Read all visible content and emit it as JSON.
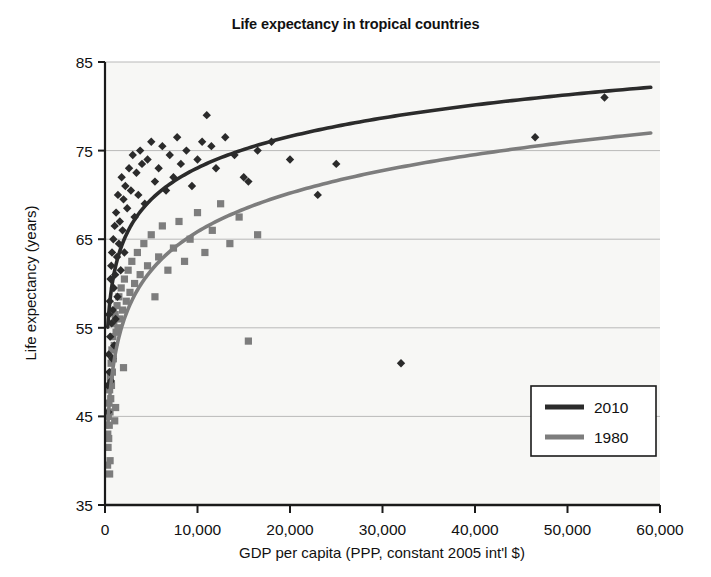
{
  "chart_data": {
    "type": "scatter",
    "title": "Life expectancy in tropical countries",
    "xlabel": "GDP per capita (PPP, constant 2005 int'l $)",
    "ylabel": "Life expectancy (years)",
    "xlim": [
      0,
      60000
    ],
    "ylim": [
      35,
      85
    ],
    "xticks": [
      0,
      10000,
      20000,
      30000,
      40000,
      50000,
      60000
    ],
    "xtick_labels": [
      "0",
      "10,000",
      "20,000",
      "30,000",
      "40,000",
      "50,000",
      "60,000"
    ],
    "yticks": [
      35,
      45,
      55,
      65,
      75,
      85
    ],
    "ytick_labels": [
      "35",
      "45",
      "55",
      "65",
      "75",
      "85"
    ],
    "grid": "horizontal",
    "legend_position": "lower-right",
    "colors": {
      "series_2010": "#2b2b2b",
      "series_1980": "#7d7d7d",
      "plot_background": "#f7f7f5",
      "gridline": "#b9b9b9",
      "axis": "#1a1a1a"
    },
    "series": [
      {
        "name": "2010",
        "marker": "diamond",
        "color": "#2b2b2b",
        "trend": "logarithmic",
        "points": [
          [
            300,
            48.5
          ],
          [
            350,
            45.5
          ],
          [
            400,
            52.0
          ],
          [
            430,
            56.5
          ],
          [
            470,
            50.0
          ],
          [
            520,
            58.0
          ],
          [
            560,
            54.0
          ],
          [
            600,
            60.5
          ],
          [
            640,
            49.0
          ],
          [
            680,
            62.0
          ],
          [
            720,
            55.5
          ],
          [
            760,
            63.5
          ],
          [
            800,
            51.5
          ],
          [
            850,
            57.0
          ],
          [
            900,
            65.0
          ],
          [
            950,
            59.5
          ],
          [
            1000,
            53.0
          ],
          [
            1050,
            66.5
          ],
          [
            1100,
            61.0
          ],
          [
            1150,
            56.0
          ],
          [
            1200,
            68.0
          ],
          [
            1300,
            63.0
          ],
          [
            1350,
            58.5
          ],
          [
            1400,
            70.0
          ],
          [
            1500,
            64.5
          ],
          [
            1600,
            67.0
          ],
          [
            1700,
            61.5
          ],
          [
            1800,
            72.0
          ],
          [
            1900,
            66.0
          ],
          [
            2000,
            69.5
          ],
          [
            2100,
            63.5
          ],
          [
            2200,
            71.0
          ],
          [
            2400,
            68.5
          ],
          [
            2600,
            73.0
          ],
          [
            2800,
            70.5
          ],
          [
            3000,
            74.5
          ],
          [
            3200,
            67.5
          ],
          [
            3400,
            72.5
          ],
          [
            3600,
            70.0
          ],
          [
            3800,
            75.0
          ],
          [
            4000,
            73.5
          ],
          [
            4300,
            69.0
          ],
          [
            4600,
            74.0
          ],
          [
            5000,
            76.0
          ],
          [
            5400,
            71.5
          ],
          [
            5800,
            73.0
          ],
          [
            6200,
            75.5
          ],
          [
            6600,
            70.5
          ],
          [
            7000,
            74.5
          ],
          [
            7400,
            72.0
          ],
          [
            7800,
            76.5
          ],
          [
            8200,
            73.5
          ],
          [
            8800,
            75.0
          ],
          [
            9400,
            71.0
          ],
          [
            10000,
            74.0
          ],
          [
            10500,
            76.0
          ],
          [
            11000,
            79.0
          ],
          [
            11500,
            75.5
          ],
          [
            12000,
            73.0
          ],
          [
            13000,
            76.5
          ],
          [
            14000,
            74.5
          ],
          [
            15000,
            72.0
          ],
          [
            15500,
            71.5
          ],
          [
            16500,
            75.0
          ],
          [
            18000,
            76.0
          ],
          [
            20000,
            74.0
          ],
          [
            23000,
            70.0
          ],
          [
            25000,
            73.5
          ],
          [
            32000,
            51.0
          ],
          [
            46500,
            76.5
          ],
          [
            54000,
            81.0
          ]
        ]
      },
      {
        "name": "1980",
        "marker": "square",
        "color": "#7d7d7d",
        "trend": "logarithmic",
        "points": [
          [
            280,
            39.5
          ],
          [
            300,
            43.0
          ],
          [
            330,
            41.5
          ],
          [
            360,
            45.0
          ],
          [
            400,
            42.5
          ],
          [
            430,
            46.5
          ],
          [
            460,
            44.0
          ],
          [
            500,
            48.0
          ],
          [
            540,
            45.5
          ],
          [
            580,
            49.5
          ],
          [
            620,
            47.0
          ],
          [
            660,
            51.0
          ],
          [
            700,
            48.5
          ],
          [
            750,
            52.5
          ],
          [
            800,
            50.0
          ],
          [
            850,
            54.0
          ],
          [
            900,
            51.5
          ],
          [
            950,
            55.5
          ],
          [
            1000,
            53.0
          ],
          [
            1100,
            56.5
          ],
          [
            1200,
            54.5
          ],
          [
            1300,
            57.5
          ],
          [
            1400,
            55.0
          ],
          [
            1500,
            58.5
          ],
          [
            1600,
            56.0
          ],
          [
            1750,
            59.5
          ],
          [
            1900,
            57.0
          ],
          [
            2100,
            60.5
          ],
          [
            2300,
            58.0
          ],
          [
            2500,
            61.5
          ],
          [
            2700,
            59.0
          ],
          [
            2900,
            62.5
          ],
          [
            3200,
            60.0
          ],
          [
            3500,
            63.5
          ],
          [
            3800,
            61.0
          ],
          [
            4200,
            64.5
          ],
          [
            4600,
            62.0
          ],
          [
            5000,
            65.5
          ],
          [
            5400,
            58.5
          ],
          [
            5800,
            63.0
          ],
          [
            6200,
            66.5
          ],
          [
            6800,
            61.5
          ],
          [
            7400,
            64.0
          ],
          [
            8000,
            67.0
          ],
          [
            8600,
            62.5
          ],
          [
            9200,
            65.0
          ],
          [
            10000,
            68.0
          ],
          [
            10800,
            63.5
          ],
          [
            11600,
            66.0
          ],
          [
            12500,
            69.0
          ],
          [
            13500,
            64.5
          ],
          [
            14500,
            67.5
          ],
          [
            15500,
            53.5
          ],
          [
            16500,
            65.5
          ],
          [
            500,
            38.5
          ],
          [
            550,
            40.0
          ],
          [
            1050,
            44.5
          ],
          [
            1150,
            46.0
          ],
          [
            2000,
            50.5
          ]
        ]
      }
    ]
  },
  "legend": {
    "entries": [
      {
        "label": "2010",
        "color": "#2b2b2b"
      },
      {
        "label": "1980",
        "color": "#7d7d7d"
      }
    ]
  }
}
